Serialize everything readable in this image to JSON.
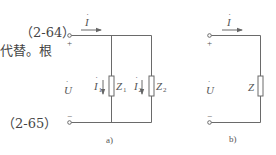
{
  "text": {
    "eq_top": "（2-64）",
    "body_fragment": "代替。根",
    "eq_bottom": "（2-65）"
  },
  "figure": {
    "panel_a": {
      "caption": "a)",
      "current_total": "I",
      "current_branch1": "I",
      "current_branch1_sub": "1",
      "current_branch2": "I",
      "current_branch2_sub": "2",
      "impedance1": "Z",
      "impedance1_sub": "1",
      "impedance2": "Z",
      "impedance2_sub": "2",
      "voltage": "U",
      "plus": "+",
      "minus": "−"
    },
    "panel_b": {
      "caption": "b)",
      "current_total": "I",
      "impedance": "Z",
      "voltage": "U",
      "plus": "+",
      "minus": "−"
    },
    "colors": {
      "line": "#6a6a6a",
      "text": "#555555"
    }
  }
}
